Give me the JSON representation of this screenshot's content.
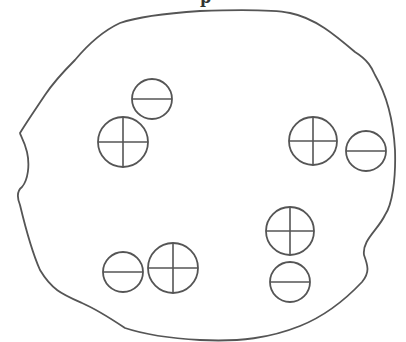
{
  "diagram": {
    "caption_fragment": "p",
    "stroke_color": "#555555",
    "background_color": "#ffffff",
    "boundary": {
      "path": "M 200 11 C 230 10, 270 9, 290 13 C 315 18, 335 35, 355 52 C 368 60, 372 68, 375 75 C 385 92, 393 115, 395 150 C 396 180, 392 205, 385 215 C 378 230, 362 240, 364 255 C 368 266, 370 272, 362 282 C 345 300, 325 316, 300 326 C 270 338, 240 342, 200 340 C 165 338, 140 333, 125 328 C 110 318, 98 310, 82 303 C 62 294, 52 290, 40 270 C 32 252, 26 230, 20 205 C 16 195, 18 190, 22 187 C 28 180, 30 165, 27 152 C 24 140, 20 135, 20 133 C 28 120, 35 110, 45 95 C 55 80, 65 70, 75 60 C 90 42, 105 30, 120 23 C 140 16, 170 13, 200 11 Z"
    },
    "particles": [
      {
        "id": 1,
        "type": "negative",
        "symbol": "minus",
        "cx": 152,
        "cy": 99,
        "r": 20
      },
      {
        "id": 2,
        "type": "positive",
        "symbol": "plus",
        "cx": 123,
        "cy": 142,
        "r": 25
      },
      {
        "id": 3,
        "type": "positive",
        "symbol": "plus",
        "cx": 313,
        "cy": 141,
        "r": 24
      },
      {
        "id": 4,
        "type": "negative",
        "symbol": "minus",
        "cx": 366,
        "cy": 151,
        "r": 20
      },
      {
        "id": 5,
        "type": "positive",
        "symbol": "plus",
        "cx": 290,
        "cy": 231,
        "r": 24
      },
      {
        "id": 6,
        "type": "negative",
        "symbol": "minus",
        "cx": 290,
        "cy": 282,
        "r": 20
      },
      {
        "id": 7,
        "type": "negative",
        "symbol": "minus",
        "cx": 123,
        "cy": 272,
        "r": 20
      },
      {
        "id": 8,
        "type": "positive",
        "symbol": "plus",
        "cx": 173,
        "cy": 268,
        "r": 25
      }
    ],
    "counts": {
      "positive": 4,
      "negative": 4
    }
  }
}
